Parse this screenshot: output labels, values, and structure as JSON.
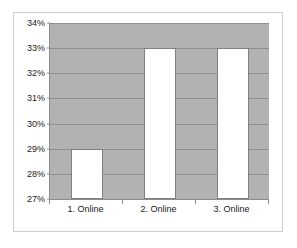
{
  "chart_data": {
    "type": "bar",
    "title": "",
    "subtitle": "",
    "xlabel": "",
    "ylabel": "",
    "categories": [
      "1. Online",
      "2. Online",
      "3. Online"
    ],
    "values": [
      29,
      33,
      33
    ],
    "value_labels": [
      "29%",
      "33%",
      "33%"
    ],
    "ylim": [
      27,
      34
    ],
    "ytick_step": 1,
    "ytick_labels": [
      "27%",
      "28%",
      "29%",
      "30%",
      "31%",
      "32%",
      "33%",
      "34%"
    ],
    "ytick_values": [
      27,
      28,
      29,
      30,
      31,
      32,
      33,
      34
    ],
    "grid": true,
    "grid_axis": "y",
    "legend": false,
    "legend_position": "none",
    "colors": {
      "bar_fill": "#ffffff",
      "bar_border": "#808080",
      "plot_background": "#b2b2b2",
      "gridline": "#8f8f8f",
      "axis_line": "#8c8c8c",
      "figure_border": "#cfcfcf",
      "text": "#1a1a1a"
    }
  }
}
